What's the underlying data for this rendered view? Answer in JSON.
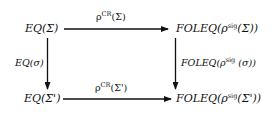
{
  "diagram": {
    "type": "commutative-square",
    "nodes": {
      "top_left": {
        "text": "EQ(Σ)"
      },
      "top_right": {
        "prefix": "FOLEQ(ρ",
        "sup": "sig",
        "suffix": "(Σ))"
      },
      "bottom_left": {
        "text": "EQ(Σ')"
      },
      "bottom_right": {
        "prefix": "FOLEQ(ρ",
        "sup": "sig",
        "suffix": "(Σ'))"
      }
    },
    "edges": {
      "top": {
        "prefix": "ρ",
        "sup": "CR",
        "suffix": "(Σ)",
        "from": "top_left",
        "to": "top_right"
      },
      "bottom": {
        "prefix": "ρ",
        "sup": "CR",
        "suffix": "(Σ')",
        "from": "bottom_left",
        "to": "bottom_right"
      },
      "left": {
        "text": "EQ(σ)",
        "from": "top_left",
        "to": "bottom_left"
      },
      "right": {
        "prefix": "FOLEQ(ρ",
        "sup": "sig",
        "suffix": " (σ))",
        "from": "top_right",
        "to": "bottom_right"
      }
    },
    "line_color": "#111111"
  }
}
